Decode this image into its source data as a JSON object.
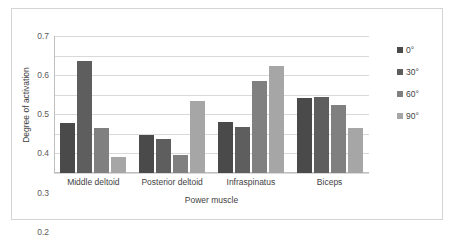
{
  "chart_data": {
    "type": "bar",
    "title": "",
    "xlabel": "Power muscle",
    "ylabel": "Degree of activation",
    "categories": [
      "Middle deltoid",
      "Posterior deltoid",
      "Infraspinatus",
      "Biceps"
    ],
    "series": [
      {
        "name": "0°",
        "color": "#4a4a4a",
        "values": [
          0.255,
          0.195,
          0.26,
          0.385
        ]
      },
      {
        "name": "30°",
        "color": "#5e5e5e",
        "values": [
          0.57,
          0.175,
          0.235,
          0.388
        ]
      },
      {
        "name": "60°",
        "color": "#808080",
        "values": [
          0.23,
          0.09,
          0.47,
          0.345
        ]
      },
      {
        "name": "90°",
        "color": "#a6a6a6",
        "values": [
          0.08,
          0.37,
          0.545,
          0.23
        ]
      }
    ],
    "ylim": [
      0,
      0.7
    ],
    "ytick_labels": [
      "0.7",
      "0.6",
      "0.5",
      "0.4",
      "0.3",
      "0.2",
      "0.1",
      "0"
    ],
    "ytick_values": [
      0.7,
      0.6,
      0.5,
      0.4,
      0.3,
      0.2,
      0.1,
      0
    ],
    "grid": true,
    "legend_position": "right",
    "frame_border_color": "#d4d4d4",
    "gridline_color": "#d9d9d9"
  }
}
